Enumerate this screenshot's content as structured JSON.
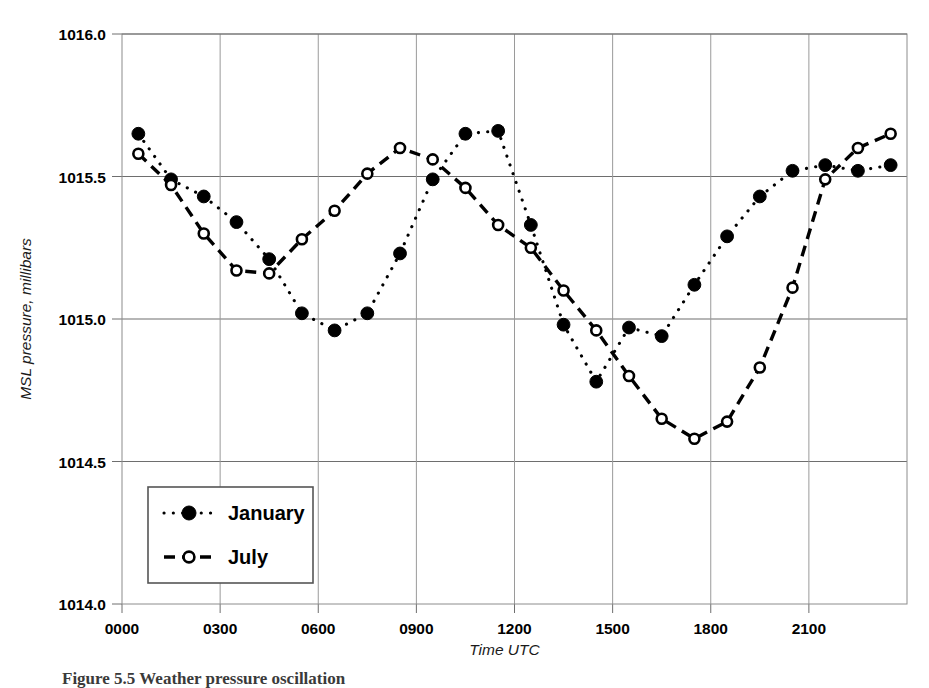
{
  "figure": {
    "caption": "Figure 5.5 Weather pressure oscillation"
  },
  "chart_data": {
    "type": "line",
    "title": "",
    "xlabel": "Time UTC",
    "ylabel": "MSL pressure, millibars",
    "xlim": [
      0,
      24
    ],
    "ylim": [
      1014.0,
      1016.0
    ],
    "ytick_labels": [
      "1014.0",
      "1014.5",
      "1015.0",
      "1015.5",
      "1016.0"
    ],
    "ytick_values": [
      1014.0,
      1014.5,
      1015.0,
      1015.5,
      1016.0
    ],
    "xtick_labels": [
      "0000",
      "0300",
      "0600",
      "0900",
      "1200",
      "1500",
      "1800",
      "2100"
    ],
    "xtick_values": [
      0,
      3,
      6,
      9,
      12,
      15,
      18,
      21
    ],
    "grid": "both",
    "legend_position": "lower-left-inside",
    "series": [
      {
        "name": "January",
        "marker": "filled-circle",
        "linestyle": "dotted",
        "color": "#000000",
        "x": [
          0.5,
          1.5,
          2.5,
          3.5,
          4.5,
          5.5,
          6.5,
          7.5,
          8.5,
          9.5,
          10.5,
          11.5,
          12.5,
          13.5,
          14.5,
          15.5,
          16.5,
          17.5,
          18.5,
          19.5,
          20.5,
          21.5,
          22.5,
          23.5
        ],
        "y": [
          1015.65,
          1015.49,
          1015.43,
          1015.34,
          1015.21,
          1015.02,
          1014.96,
          1015.02,
          1015.23,
          1015.49,
          1015.65,
          1015.66,
          1015.33,
          1014.98,
          1014.78,
          1014.97,
          1014.94,
          1015.12,
          1015.29,
          1015.43,
          1015.52,
          1015.54,
          1015.52,
          1015.54
        ]
      },
      {
        "name": "July",
        "marker": "open-circle",
        "linestyle": "dashed",
        "color": "#000000",
        "x": [
          0.5,
          1.5,
          2.5,
          3.5,
          4.5,
          5.5,
          6.5,
          7.5,
          8.5,
          9.5,
          10.5,
          11.5,
          12.5,
          13.5,
          14.5,
          15.5,
          16.5,
          17.5,
          18.5,
          19.5,
          20.5,
          21.5,
          22.5,
          23.5
        ],
        "y": [
          1015.58,
          1015.47,
          1015.3,
          1015.17,
          1015.16,
          1015.28,
          1015.38,
          1015.51,
          1015.6,
          1015.56,
          1015.46,
          1015.33,
          1015.25,
          1015.1,
          1014.96,
          1014.8,
          1014.65,
          1014.58,
          1014.64,
          1014.83,
          1015.11,
          1015.49,
          1015.6,
          1015.65
        ]
      }
    ]
  },
  "legend": {
    "entries": [
      {
        "label": "January",
        "marker": "filled-circle",
        "linestyle": "dotted"
      },
      {
        "label": "July",
        "marker": "open-circle",
        "linestyle": "dashed"
      }
    ]
  }
}
